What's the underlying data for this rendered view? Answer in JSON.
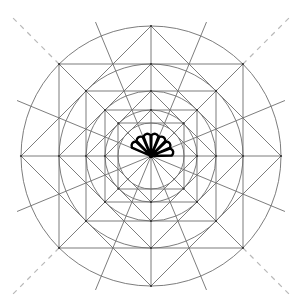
{
  "diagram": {
    "title": "",
    "type": "geometric-construction",
    "canvas": {
      "width": 301,
      "height": 308
    },
    "center": {
      "x": 151,
      "y": 156
    },
    "colors": {
      "line": "#6e6e6e",
      "dashed": "#b8b8b8",
      "fan": "#000000",
      "background": "#ffffff"
    },
    "circles": [
      130,
      92,
      65,
      46,
      33
    ],
    "squares_axis_aligned_halfside": [
      92,
      65,
      46,
      33
    ],
    "diamonds_radius": [
      130,
      92,
      65,
      46
    ],
    "radial_lines": {
      "count": 16,
      "step_deg": 22.5,
      "inner_length": 130,
      "extended_angles_deg": [
        22.5,
        67.5,
        112.5,
        157.5,
        202.5,
        247.5,
        292.5,
        337.5
      ],
      "extended_length": 145
    },
    "dashed_extensions": {
      "angles_deg": [
        45,
        135,
        225,
        315
      ],
      "from": 130,
      "to": 196
    },
    "fan": {
      "petals": 7,
      "start_deg": 157.5,
      "end_deg": 0,
      "radius": 22
    }
  }
}
